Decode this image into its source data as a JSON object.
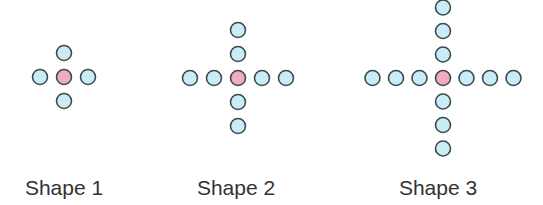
{
  "colors": {
    "outer_fill": "#c9ecf6",
    "center_fill": "#f3aabf",
    "stroke": "#3a4a4f",
    "label": "#333333"
  },
  "shapes": [
    {
      "label": "Shape 1",
      "center": [
        64,
        77
      ],
      "arm_length": 1,
      "spacing": 24,
      "label_x": 64
    },
    {
      "label": "Shape 2",
      "center": [
        238,
        78
      ],
      "arm_length": 2,
      "spacing": 24,
      "label_x": 236
    },
    {
      "label": "Shape 3",
      "center": [
        443,
        78
      ],
      "arm_length": 3,
      "spacing": 23.5,
      "label_x": 438
    }
  ],
  "circle_radius": 7.5
}
